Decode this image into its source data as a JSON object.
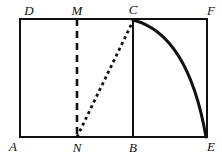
{
  "figure": {
    "background_color": "#ffffff",
    "stroke_color": "#111111",
    "canvas": {
      "width": 222,
      "height": 154
    },
    "rectangle": {
      "name": "rectangle-ADFE",
      "left": 20,
      "top": 19,
      "right": 207,
      "bottom": 137,
      "stroke_width": 2.6
    },
    "segments": [
      {
        "name": "segment-MN",
        "style": "dashed",
        "x1": 77,
        "y1": 19,
        "x2": 77,
        "y2": 137,
        "stroke_width": 2.6,
        "dash": "7 5"
      },
      {
        "name": "segment-NC",
        "style": "dotted",
        "x1": 77,
        "y1": 137,
        "x2": 133,
        "y2": 21,
        "stroke_width": 2.8,
        "dash": "3 3.4"
      },
      {
        "name": "segment-CB",
        "style": "solid",
        "x1": 133,
        "y1": 19,
        "x2": 133,
        "y2": 137,
        "stroke_width": 2.0,
        "dash": "none"
      }
    ],
    "curve": {
      "name": "curve-CE",
      "style": "solid",
      "stroke_width": 3.0,
      "start_x": 133,
      "start_y": 20,
      "control_x": 188,
      "control_y": 34,
      "end_x": 206,
      "end_y": 137,
      "description": "concave curve from C descending to E"
    },
    "labels": [
      {
        "name": "vertex-label-D",
        "text": "D",
        "x": 29,
        "y": 10
      },
      {
        "name": "vertex-label-M",
        "text": "M",
        "x": 77,
        "y": 10
      },
      {
        "name": "vertex-label-C",
        "text": "C",
        "x": 133,
        "y": 9
      },
      {
        "name": "vertex-label-F",
        "text": "F",
        "x": 211,
        "y": 10
      },
      {
        "name": "vertex-label-A",
        "text": "A",
        "x": 13,
        "y": 146
      },
      {
        "name": "vertex-label-N",
        "text": "N",
        "x": 77,
        "y": 147
      },
      {
        "name": "vertex-label-B",
        "text": "B",
        "x": 133,
        "y": 147
      },
      {
        "name": "vertex-label-E",
        "text": "E",
        "x": 211,
        "y": 146
      }
    ]
  }
}
